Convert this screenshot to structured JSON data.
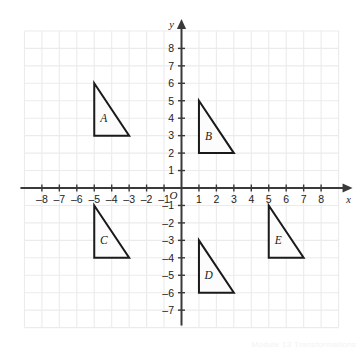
{
  "figure": {
    "watermark": "Module 13  Transformations"
  },
  "chart_data": {
    "type": "scatter",
    "title": "",
    "xlabel": "x",
    "ylabel": "y",
    "xlim": [
      -9,
      9
    ],
    "ylim": [
      -8,
      9
    ],
    "grid": true,
    "grid_step": 1,
    "legend": "none",
    "origin_label": "O",
    "x_ticks": [
      -8,
      -7,
      -6,
      -5,
      -4,
      -3,
      -2,
      -1,
      1,
      2,
      3,
      4,
      5,
      6,
      7,
      8
    ],
    "x_tick_labels": [
      "–8",
      "–7",
      "–6",
      "–5",
      "–4",
      "–3",
      "–2",
      "–1",
      "1",
      "2",
      "3",
      "4",
      "5",
      "6",
      "7",
      "8"
    ],
    "y_ticks": [
      8,
      7,
      6,
      5,
      4,
      3,
      2,
      1,
      -1,
      -2,
      -3,
      -4,
      -5,
      -6,
      -7
    ],
    "y_tick_labels": [
      "8",
      "7",
      "6",
      "5",
      "4",
      "3",
      "2",
      "1",
      "–1",
      "–2",
      "–3",
      "–4",
      "–5",
      "–6",
      "–7"
    ],
    "shapes": [
      {
        "name": "A",
        "label": "A",
        "type": "right-triangle",
        "vertices": [
          [
            -5,
            6
          ],
          [
            -5,
            3
          ],
          [
            -3,
            3
          ]
        ],
        "label_position": [
          -4.45,
          4.0
        ],
        "stroke": "#1a1a1a",
        "fill": "#fcfcfc"
      },
      {
        "name": "B",
        "label": "B",
        "type": "right-triangle",
        "vertices": [
          [
            1,
            5
          ],
          [
            1,
            2
          ],
          [
            3,
            2
          ]
        ],
        "label_position": [
          1.55,
          3.0
        ],
        "stroke": "#1a1a1a",
        "fill": "#fcfcfc"
      },
      {
        "name": "C",
        "label": "C",
        "type": "right-triangle",
        "vertices": [
          [
            -5,
            -1
          ],
          [
            -5,
            -4
          ],
          [
            -3,
            -4
          ]
        ],
        "label_position": [
          -4.45,
          -3.0
        ],
        "stroke": "#1a1a1a",
        "fill": "#fcfcfc"
      },
      {
        "name": "D",
        "label": "D",
        "type": "right-triangle",
        "vertices": [
          [
            1,
            -3
          ],
          [
            1,
            -6
          ],
          [
            3,
            -6
          ]
        ],
        "label_position": [
          1.55,
          -5.0
        ],
        "stroke": "#1a1a1a",
        "fill": "#fcfcfc"
      },
      {
        "name": "E",
        "label": "E",
        "type": "right-triangle",
        "vertices": [
          [
            5,
            -1
          ],
          [
            5,
            -4
          ],
          [
            7,
            -4
          ]
        ],
        "label_position": [
          5.55,
          -3.0
        ],
        "stroke": "#1a1a1a",
        "fill": "#fcfcfc"
      }
    ],
    "colors": {
      "grid": "#ebebeb",
      "axis": "#3a3a3a",
      "shape_stroke": "#1a1a1a",
      "shape_fill": "#fcfcfc",
      "tick_label": "#222222",
      "background": "#ffffff"
    }
  }
}
